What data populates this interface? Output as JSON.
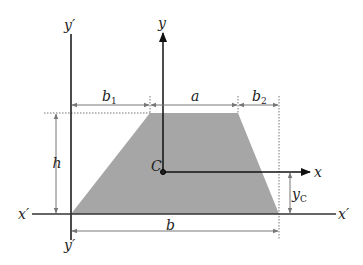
{
  "diagram": {
    "colors": {
      "fill": "#a6a6a6",
      "axis": "#111111",
      "dim": "#777777"
    },
    "labels": {
      "y_prime_top": "y′",
      "y_prime_bottom": "y′",
      "y": "y",
      "x": "x",
      "x_prime_left": "x′",
      "x_prime_right": "x′",
      "centroid": "C",
      "b1": "b",
      "b1_sub": "1",
      "a": "a",
      "b2": "b",
      "b2_sub": "2",
      "h": "h",
      "b": "b",
      "yc": "y",
      "yc_sub": "C"
    }
  }
}
